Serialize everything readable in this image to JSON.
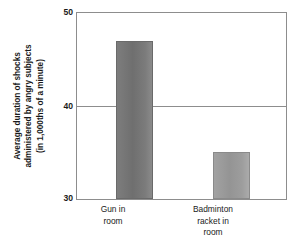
{
  "chart_data": {
    "type": "bar",
    "title": "",
    "subtitle": "",
    "xlabel": "",
    "ylabel": "Average duration of shocks administered by angry subjects (in 1,000ths of a minute)",
    "ylabel_lines": [
      "Average duration of shocks",
      "administered by angry subjects",
      "(in 1,000ths of a minute)"
    ],
    "categories": [
      "Gun in room",
      "Badminton racket in room"
    ],
    "category_lines": [
      [
        "Gun in",
        "room"
      ],
      [
        "Badminton",
        "racket in",
        "room"
      ]
    ],
    "values": [
      47,
      35
    ],
    "ylim": [
      30,
      50
    ],
    "yticks": [
      "30",
      "40",
      "50"
    ],
    "ytick_values": [
      30,
      40,
      50
    ],
    "grid": "horizontal-at-40",
    "legend": "none",
    "bar_colors": [
      "#6f6f6f",
      "#949494"
    ],
    "frame_color": "#8d8d8d",
    "background_color": "#ffffff"
  }
}
